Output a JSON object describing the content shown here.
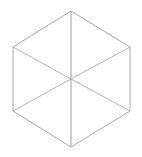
{
  "canvas": {
    "width": 142,
    "height": 157,
    "background_color": "#ffffff"
  },
  "figure": {
    "name": "isometric-cube-wireframe",
    "stroke_color": "#a8a8a8",
    "inner_stroke_color": "#b4b4b4",
    "vertical_stroke_color": "#9e9e9e",
    "stroke_width": 1
  },
  "chart_data": {
    "type": "scatter",
    "title": "",
    "subtitle": "",
    "xlabel": "",
    "ylabel": "",
    "xlim": [
      0,
      142
    ],
    "ylim": [
      0,
      157
    ],
    "grid": false,
    "legend": "none",
    "annotations": [],
    "vertices": {
      "top": {
        "x": 71,
        "y": 11
      },
      "upper_right": {
        "x": 130,
        "y": 47
      },
      "lower_right": {
        "x": 130,
        "y": 111
      },
      "bottom": {
        "x": 71,
        "y": 147
      },
      "lower_left": {
        "x": 13,
        "y": 111
      },
      "upper_left": {
        "x": 13,
        "y": 47
      },
      "center": {
        "x": 71,
        "y": 79
      }
    },
    "outline_path": "M 71 11 L 130 47 L 130 111 L 71 147 L 13 111 L 13 47 Z",
    "inner_edges": [
      {
        "name": "center-to-top",
        "x1": 71,
        "y1": 11,
        "x2": 71,
        "y2": 79
      },
      {
        "name": "center-to-lower-left",
        "x1": 71,
        "y1": 79,
        "x2": 13,
        "y2": 111
      },
      {
        "name": "center-to-lower-right",
        "x1": 71,
        "y1": 79,
        "x2": 130,
        "y2": 111
      },
      {
        "name": "center-to-upper-left",
        "x1": 71,
        "y1": 79,
        "x2": 13,
        "y2": 47
      },
      {
        "name": "center-to-upper-right",
        "x1": 71,
        "y1": 79,
        "x2": 130,
        "y2": 47
      },
      {
        "name": "center-to-bottom",
        "x1": 71,
        "y1": 79,
        "x2": 71,
        "y2": 147
      }
    ]
  }
}
